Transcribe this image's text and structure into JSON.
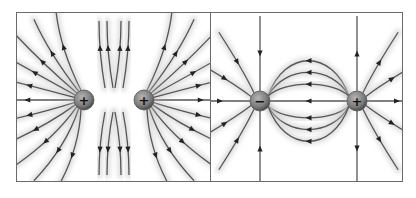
{
  "figure": {
    "panels": [
      {
        "id": "left",
        "description": "Electric field lines between two like (positive) charges",
        "charges": [
          {
            "sign": "+",
            "label": "+",
            "x": 67,
            "y": 87
          },
          {
            "sign": "+",
            "label": "+",
            "x": 127,
            "y": 87
          }
        ]
      },
      {
        "id": "right",
        "description": "Electric field lines between opposite charges (dipole)",
        "charges": [
          {
            "sign": "-",
            "label": "−",
            "x": 49,
            "y": 88
          },
          {
            "sign": "+",
            "label": "+",
            "x": 146,
            "y": 88
          }
        ]
      }
    ],
    "colors": {
      "border": "#6a6a6a",
      "field_line": "#555555",
      "arrow": "#222222",
      "charge_fill": "#8a8a8a"
    }
  }
}
